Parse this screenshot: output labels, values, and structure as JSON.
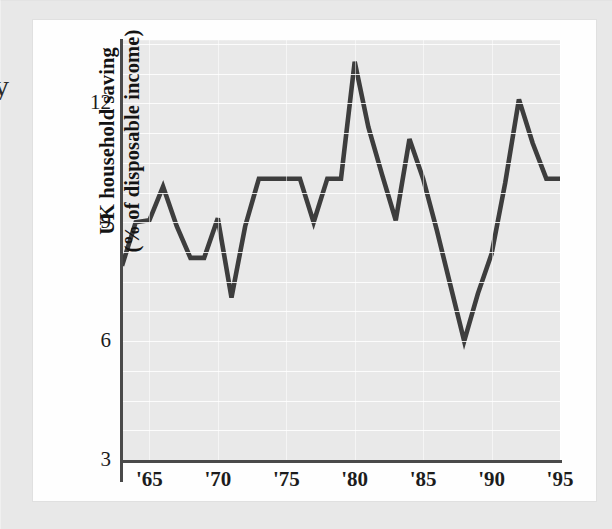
{
  "figure": {
    "edge_fragment": "y",
    "y_axis_title_line1": "UK household saving",
    "y_axis_title_line2": "(% of disposable income)",
    "y_ticks": [
      "3",
      "6",
      "9",
      "12"
    ],
    "x_ticks": [
      "'65",
      "'70",
      "'75",
      "'80",
      "'85",
      "'90",
      "'95"
    ],
    "line_color": "#3d3d3d",
    "plot_background": "#e9e9e9",
    "card_background": "#fefefe",
    "page_background": "#e8e8e8"
  },
  "chart_data": {
    "type": "line",
    "title": "",
    "xlabel": "",
    "ylabel": "UK household saving (% of disposable income)",
    "xlim": [
      1963,
      1995
    ],
    "ylim": [
      3,
      13.6
    ],
    "yticks": [
      3,
      6,
      9,
      12
    ],
    "xticks": [
      1965,
      1970,
      1975,
      1980,
      1985,
      1990,
      1995
    ],
    "xtick_labels": [
      "'65",
      "'70",
      "'75",
      "'80",
      "'85",
      "'90",
      "'95"
    ],
    "grid": true,
    "legend": "none",
    "series": [
      {
        "name": "UK household saving ratio",
        "color": "#3d3d3d",
        "x": [
          1963,
          1964,
          1965,
          1966,
          1967,
          1968,
          1969,
          1970,
          1971,
          1972,
          1973,
          1974,
          1975,
          1976,
          1977,
          1978,
          1979,
          1980,
          1981,
          1982,
          1983,
          1984,
          1985,
          1986,
          1987,
          1988,
          1989,
          1990,
          1991,
          1992,
          1993,
          1994,
          1995
        ],
        "values": [
          7.9,
          9.0,
          9.05,
          9.9,
          8.9,
          8.1,
          8.1,
          9.1,
          7.1,
          8.9,
          10.1,
          10.1,
          10.1,
          10.1,
          9.0,
          10.1,
          10.1,
          13.05,
          11.4,
          10.2,
          9.05,
          11.1,
          10.1,
          8.8,
          7.4,
          6.0,
          7.2,
          8.2,
          10.0,
          12.1,
          11.0,
          10.1,
          10.1
        ]
      }
    ]
  }
}
